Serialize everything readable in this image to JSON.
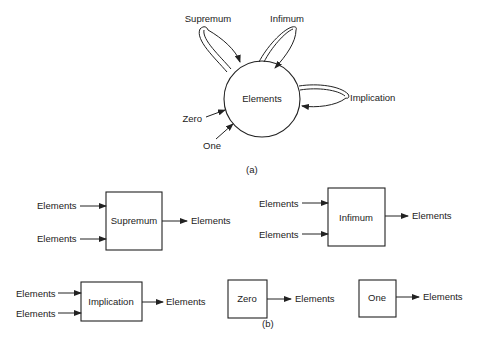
{
  "part_a": {
    "caption": "(a)",
    "center_node": "Elements",
    "loops": [
      {
        "name": "Supremum"
      },
      {
        "name": "Infimum"
      },
      {
        "name": "Implication"
      }
    ],
    "constants": [
      {
        "name": "Zero"
      },
      {
        "name": "One"
      }
    ]
  },
  "part_b": {
    "caption": "(b)",
    "operators": [
      {
        "name": "Supremum",
        "inputs": [
          "Elements",
          "Elements"
        ],
        "output": "Elements"
      },
      {
        "name": "Infimum",
        "inputs": [
          "Elements",
          "Elements"
        ],
        "output": "Elements"
      },
      {
        "name": "Implication",
        "inputs": [
          "Elements",
          "Elements"
        ],
        "output": "Elements"
      },
      {
        "name": "Zero",
        "inputs": [],
        "output": "Elements"
      },
      {
        "name": "One",
        "inputs": [],
        "output": "Elements"
      }
    ]
  },
  "colors": {
    "stroke": "#222222",
    "background": "#ffffff"
  }
}
